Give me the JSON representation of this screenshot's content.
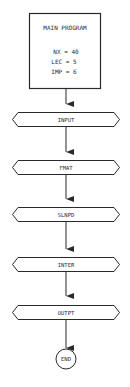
{
  "diagram": {
    "type": "flowchart",
    "colors": {
      "stroke": "#2a2a2a",
      "background": "#ffffff",
      "text": "#2a2a2a"
    },
    "main_box": {
      "title": "MAIN PROGRAM",
      "lines": [
        "NX = 40",
        "LEC = 5",
        "IMP = 6"
      ]
    },
    "steps": [
      {
        "label": "INPUT"
      },
      {
        "label": "FMAT"
      },
      {
        "label": "SLNPD"
      },
      {
        "label": "INTER"
      },
      {
        "label": "OUTPT"
      }
    ],
    "terminator": {
      "label": "END"
    }
  }
}
